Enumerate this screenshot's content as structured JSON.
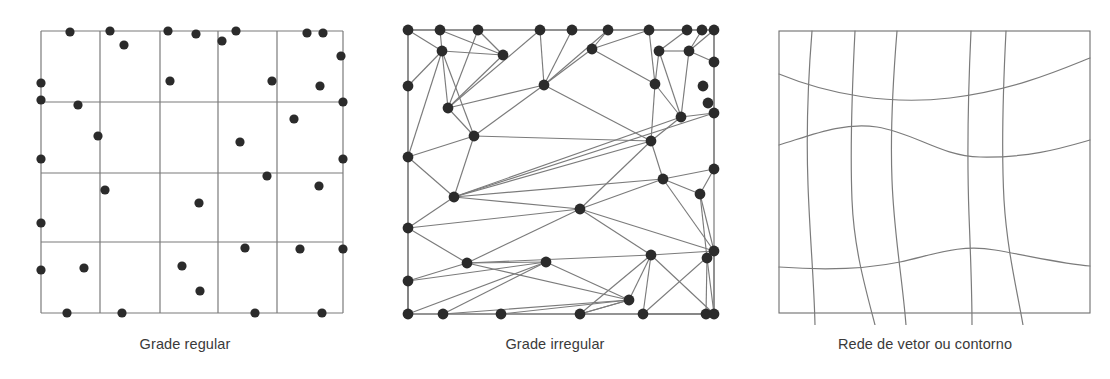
{
  "figure": {
    "background_color": "#ffffff",
    "line_color": "#7b7b7b",
    "border_color": "#6e6e6e",
    "node_color": "#2b2b2b",
    "caption_color": "#3a3a3a"
  },
  "panels": [
    {
      "id": "grade-regular",
      "caption": "Grade regular",
      "box": {
        "x": 41,
        "y": 31,
        "w": 302,
        "h": 282
      },
      "columns_x": [
        41,
        100,
        160,
        218,
        277,
        343
      ],
      "rows_y": [
        31,
        102,
        173,
        242,
        313
      ],
      "dot_radius": 4.6,
      "dots": [
        [
          70,
          32
        ],
        [
          110,
          31
        ],
        [
          168,
          31
        ],
        [
          196,
          34
        ],
        [
          236,
          31
        ],
        [
          307,
          33
        ],
        [
          323,
          33
        ],
        [
          124,
          45
        ],
        [
          222,
          41
        ],
        [
          341,
          56
        ],
        [
          41,
          83
        ],
        [
          170,
          81
        ],
        [
          272,
          81
        ],
        [
          320,
          86
        ],
        [
          78,
          105
        ],
        [
          41,
          100
        ],
        [
          343,
          102
        ],
        [
          98,
          136
        ],
        [
          294,
          119
        ],
        [
          240,
          142
        ],
        [
          41,
          159
        ],
        [
          343,
          159
        ],
        [
          105,
          190
        ],
        [
          267,
          176
        ],
        [
          319,
          186
        ],
        [
          199,
          203
        ],
        [
          41,
          223
        ],
        [
          245,
          248
        ],
        [
          300,
          249
        ],
        [
          343,
          249
        ],
        [
          84,
          268
        ],
        [
          182,
          266
        ],
        [
          41,
          270
        ],
        [
          200,
          291
        ],
        [
          67,
          313
        ],
        [
          122,
          313
        ],
        [
          255,
          313
        ],
        [
          322,
          313
        ]
      ]
    },
    {
      "id": "grade-irregular",
      "caption": "Grade irregular",
      "box": {
        "x": 408,
        "y": 30,
        "w": 306,
        "h": 284
      },
      "node_radius": 5.4,
      "nodes": [
        [
          408,
          30
        ],
        [
          440,
          30
        ],
        [
          478,
          30
        ],
        [
          540,
          30
        ],
        [
          572,
          30
        ],
        [
          608,
          30
        ],
        [
          649,
          30
        ],
        [
          687,
          30
        ],
        [
          702,
          30
        ],
        [
          714,
          30
        ],
        [
          408,
          86
        ],
        [
          408,
          157
        ],
        [
          408,
          228
        ],
        [
          408,
          281
        ],
        [
          408,
          314
        ],
        [
          714,
          62
        ],
        [
          714,
          113
        ],
        [
          714,
          169
        ],
        [
          714,
          251
        ],
        [
          714,
          314
        ],
        [
          442,
          51
        ],
        [
          503,
          55
        ],
        [
          592,
          49
        ],
        [
          659,
          51
        ],
        [
          689,
          51
        ],
        [
          448,
          108
        ],
        [
          544,
          85
        ],
        [
          655,
          84
        ],
        [
          703,
          86
        ],
        [
          708,
          103
        ],
        [
          474,
          136
        ],
        [
          651,
          141
        ],
        [
          681,
          117
        ],
        [
          454,
          197
        ],
        [
          663,
          179
        ],
        [
          700,
          194
        ],
        [
          580,
          209
        ],
        [
          651,
          255
        ],
        [
          707,
          258
        ],
        [
          467,
          263
        ],
        [
          546,
          262
        ],
        [
          629,
          300
        ],
        [
          443,
          314
        ],
        [
          501,
          314
        ],
        [
          580,
          314
        ],
        [
          643,
          314
        ],
        [
          706,
          314
        ]
      ],
      "edges": [
        [
          0,
          20
        ],
        [
          0,
          1
        ],
        [
          1,
          20
        ],
        [
          0,
          10
        ],
        [
          10,
          20
        ],
        [
          1,
          2
        ],
        [
          2,
          21
        ],
        [
          20,
          21
        ],
        [
          1,
          21
        ],
        [
          2,
          25
        ],
        [
          21,
          25
        ],
        [
          3,
          25
        ],
        [
          2,
          3
        ],
        [
          3,
          4
        ],
        [
          4,
          26
        ],
        [
          3,
          26
        ],
        [
          25,
          26
        ],
        [
          4,
          5
        ],
        [
          5,
          26
        ],
        [
          5,
          22
        ],
        [
          22,
          26
        ],
        [
          5,
          6
        ],
        [
          6,
          22
        ],
        [
          6,
          27
        ],
        [
          22,
          27
        ],
        [
          6,
          7
        ],
        [
          7,
          23
        ],
        [
          23,
          27
        ],
        [
          7,
          8
        ],
        [
          8,
          24
        ],
        [
          23,
          24
        ],
        [
          8,
          9
        ],
        [
          9,
          15
        ],
        [
          24,
          15
        ],
        [
          9,
          24
        ],
        [
          10,
          11
        ],
        [
          11,
          20
        ],
        [
          20,
          25
        ],
        [
          25,
          30
        ],
        [
          20,
          30
        ],
        [
          11,
          30
        ],
        [
          26,
          30
        ],
        [
          26,
          31
        ],
        [
          27,
          31
        ],
        [
          27,
          32
        ],
        [
          32,
          31
        ],
        [
          23,
          32
        ],
        [
          24,
          32
        ],
        [
          15,
          16
        ],
        [
          16,
          32
        ],
        [
          32,
          33
        ],
        [
          16,
          33
        ],
        [
          30,
          31
        ],
        [
          11,
          33
        ],
        [
          30,
          33
        ],
        [
          11,
          12
        ],
        [
          12,
          33
        ],
        [
          33,
          31
        ],
        [
          31,
          36
        ],
        [
          33,
          36
        ],
        [
          34,
          36
        ],
        [
          31,
          34
        ],
        [
          16,
          17
        ],
        [
          17,
          34
        ],
        [
          34,
          35
        ],
        [
          17,
          35
        ],
        [
          35,
          18
        ],
        [
          34,
          18
        ],
        [
          36,
          18
        ],
        [
          36,
          39
        ],
        [
          12,
          39
        ],
        [
          12,
          13
        ],
        [
          13,
          39
        ],
        [
          36,
          37
        ],
        [
          37,
          18
        ],
        [
          39,
          37
        ],
        [
          35,
          38
        ],
        [
          18,
          38
        ],
        [
          38,
          19
        ],
        [
          18,
          19
        ],
        [
          13,
          40
        ],
        [
          39,
          40
        ],
        [
          13,
          14
        ],
        [
          14,
          40
        ],
        [
          40,
          41
        ],
        [
          14,
          42
        ],
        [
          40,
          42
        ],
        [
          42,
          41
        ],
        [
          41,
          43
        ],
        [
          43,
          44
        ],
        [
          41,
          44
        ],
        [
          37,
          44
        ],
        [
          41,
          37
        ],
        [
          44,
          45
        ],
        [
          37,
          45
        ],
        [
          45,
          19
        ],
        [
          37,
          19
        ],
        [
          18,
          45
        ],
        [
          46,
          19
        ],
        [
          45,
          46
        ],
        [
          38,
          46
        ],
        [
          33,
          34
        ],
        [
          39,
          41
        ],
        [
          42,
          43
        ],
        [
          14,
          13
        ],
        [
          12,
          36
        ],
        [
          44,
          41
        ]
      ]
    },
    {
      "id": "rede-vetor-contorno",
      "caption": "Rede de vetor ou contorno",
      "box": {
        "x": 779,
        "y": 31,
        "w": 311,
        "h": 282
      },
      "vertical_curve_count": 5,
      "horizontal_curve_count": 3,
      "vertical_curves": [
        "M 812 31 C 808 80, 806 130, 808 185 C 810 240, 814 280, 815 325",
        "M 855 31 C 852 90, 850 150, 852 200 C 854 250, 866 290, 875 325",
        "M 897 31 C 893 80, 890 130, 892 180 C 894 235, 902 275, 906 325",
        "M 971 31 C 968 95, 967 160, 969 215 C 971 265, 972 295, 972 325",
        "M 1006 31 C 1003 90, 1001 145, 1004 200 C 1007 250, 1017 290, 1023 325"
      ],
      "horizontal_curves": [
        "M 779 74 C 830 95, 890 105, 950 98 C 1015 90, 1060 70, 1090 58",
        "M 779 145 C 812 135, 842 122, 877 127 C 915 133, 940 156, 980 157 C 1030 158, 1062 148, 1090 140",
        "M 779 267 C 820 270, 862 270, 900 262 C 936 254, 960 244, 995 250 C 1035 257, 1065 264, 1090 266"
      ]
    }
  ]
}
